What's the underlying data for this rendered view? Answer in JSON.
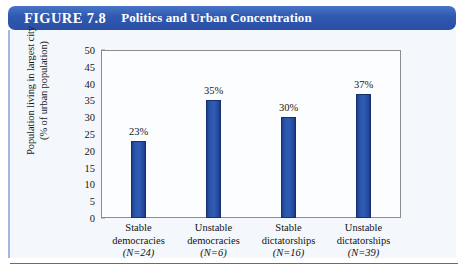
{
  "figure": {
    "number": "FIGURE 7.8",
    "title": "Politics and Urban Concentration"
  },
  "chart_data": {
    "type": "bar",
    "title": "Politics and Urban Concentration",
    "xlabel": "",
    "ylabel": "Population living in largest city (% of urban population)",
    "ylabel_line1": "Population living in largest city",
    "ylabel_line2": "(% of urban population)",
    "ylim": [
      0,
      50
    ],
    "ytick_step": 5,
    "yticks": [
      "50",
      "45",
      "40",
      "35",
      "30",
      "25",
      "20",
      "15",
      "10",
      "5",
      "0"
    ],
    "grid": false,
    "legend": null,
    "categories": [
      "Stable democracies",
      "Unstable democracies",
      "Stable dictatorships",
      "Unstable dictatorships"
    ],
    "values": [
      23,
      35,
      30,
      37
    ],
    "value_labels": [
      "23%",
      "35%",
      "30%",
      "37%"
    ],
    "bars": [
      {
        "line1": "Stable",
        "line2": "democracies",
        "line3": "(N=24)",
        "value": 23,
        "value_label": "23%",
        "n": 24
      },
      {
        "line1": "Unstable",
        "line2": "democracies",
        "line3": "(N=6)",
        "value": 35,
        "value_label": "35%",
        "n": 6
      },
      {
        "line1": "Stable",
        "line2": "dictatorships",
        "line3": "(N=16)",
        "value": 30,
        "value_label": "30%",
        "n": 16
      },
      {
        "line1": "Unstable",
        "line2": "dictatorships",
        "line3": "(N=39)",
        "value": 37,
        "value_label": "37%",
        "n": 39
      }
    ],
    "colors": {
      "bar_fill": "#2a55aa",
      "bar_edge": "#16306f",
      "banner": "#2f58b0",
      "panel_background": "#f4f8fc",
      "plot_background": "#fbfdff",
      "axis": "#8d8d8d",
      "text": "#151515"
    }
  }
}
